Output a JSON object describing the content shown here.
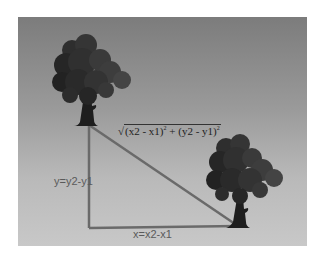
{
  "diagram": {
    "labels": {
      "vertical": "y=y2-y1",
      "horizontal": "x=x2-x1",
      "hypotenuse_part1": "(x2 - x1)",
      "hypotenuse_part2": " + (y2 - y1)",
      "exp": "2",
      "radical": "√"
    },
    "colors": {
      "line": "#6a6a6a",
      "tree_canopy": "#2b2b2b",
      "background_top": "#7c7c7c",
      "background_bottom": "#c8c8c8"
    },
    "nodes": [
      {
        "id": "tree-1",
        "x": 89,
        "y": 125
      },
      {
        "id": "tree-2",
        "x": 238,
        "y": 226
      }
    ],
    "corner": {
      "x": 89,
      "y": 228
    }
  }
}
